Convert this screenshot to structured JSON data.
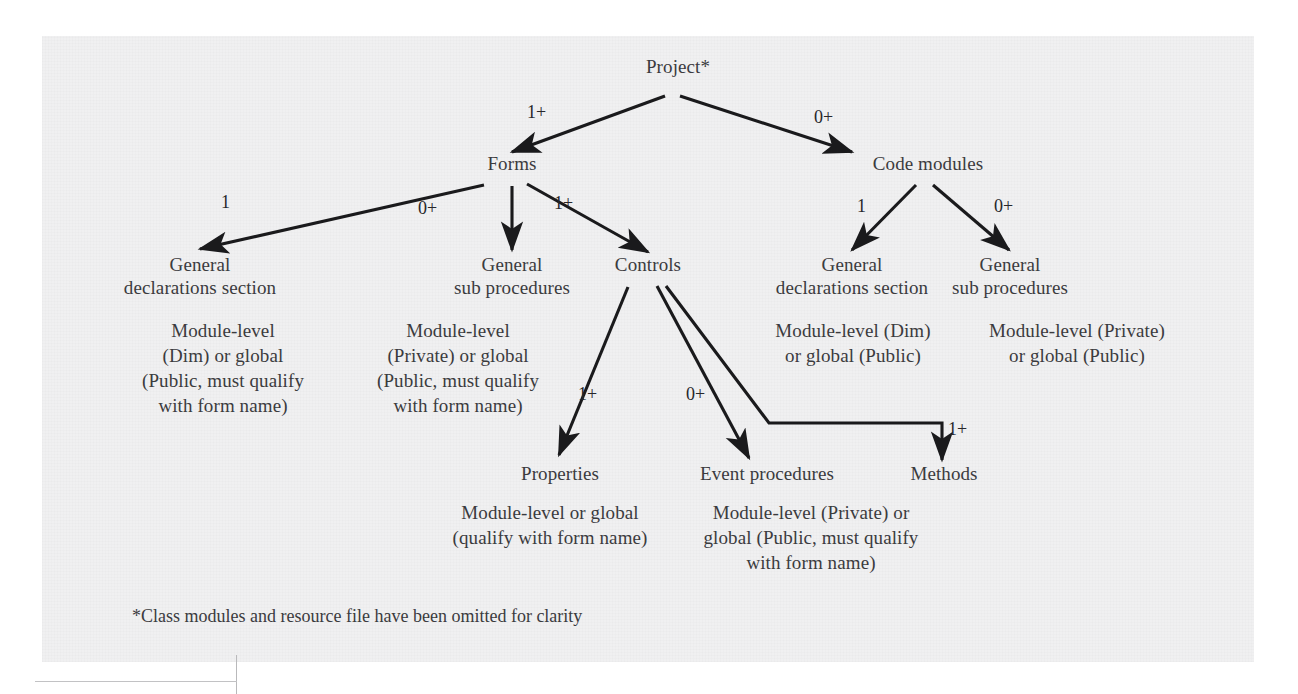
{
  "figure": {
    "type": "hierarchy-tree-diagram",
    "footnote": "*Class modules and resource file have been omitted for clarity"
  },
  "nodes": {
    "project": {
      "label": "Project*"
    },
    "forms": {
      "label": "Forms"
    },
    "code_modules": {
      "label": "Code modules"
    },
    "forms_general_declarations": {
      "label": "General\ndeclarations section",
      "description": "Module-level\n(Dim) or global\n(Public, must qualify\nwith form name)"
    },
    "forms_general_sub": {
      "label": "General\nsub procedures",
      "description": "Module-level\n(Private) or global\n(Public, must qualify\nwith form name)"
    },
    "controls": {
      "label": "Controls"
    },
    "modules_general_declarations": {
      "label": "General\ndeclarations section",
      "description": "Module-level (Dim)\nor global (Public)"
    },
    "modules_general_sub": {
      "label": "General\nsub procedures",
      "description": "Module-level (Private)\nor global (Public)"
    },
    "properties": {
      "label": "Properties",
      "description": "Module-level or global\n(qualify with form name)"
    },
    "event_procedures": {
      "label": "Event procedures",
      "description": "Module-level (Private) or\nglobal (Public, must qualify\nwith form name)"
    },
    "methods": {
      "label": "Methods"
    }
  },
  "edges": [
    {
      "from": "project",
      "to": "forms",
      "multiplicity": "1+"
    },
    {
      "from": "project",
      "to": "code_modules",
      "multiplicity": "0+"
    },
    {
      "from": "forms",
      "to": "forms_general_declarations",
      "multiplicity": "1"
    },
    {
      "from": "forms",
      "to": "forms_general_sub",
      "multiplicity": "0+"
    },
    {
      "from": "forms",
      "to": "controls",
      "multiplicity": "1+"
    },
    {
      "from": "code_modules",
      "to": "modules_general_declarations",
      "multiplicity": "1"
    },
    {
      "from": "code_modules",
      "to": "modules_general_sub",
      "multiplicity": "0+"
    },
    {
      "from": "controls",
      "to": "properties",
      "multiplicity": "1+"
    },
    {
      "from": "controls",
      "to": "event_procedures",
      "multiplicity": "0+"
    },
    {
      "from": "controls",
      "to": "methods",
      "multiplicity": "1+"
    }
  ],
  "edge_labels": {
    "project_forms": "1+",
    "project_code_modules": "0+",
    "forms_declarations": "1",
    "forms_sub": "0+",
    "forms_controls": "1+",
    "modules_declarations": "1",
    "modules_sub": "0+",
    "controls_properties": "1+",
    "controls_events": "0+",
    "controls_methods": "1+"
  },
  "colors": {
    "ink": "#3b3b3e",
    "line": "#1a1a1c",
    "paper": "#f0f0f1",
    "page_background": "#ffffff"
  }
}
